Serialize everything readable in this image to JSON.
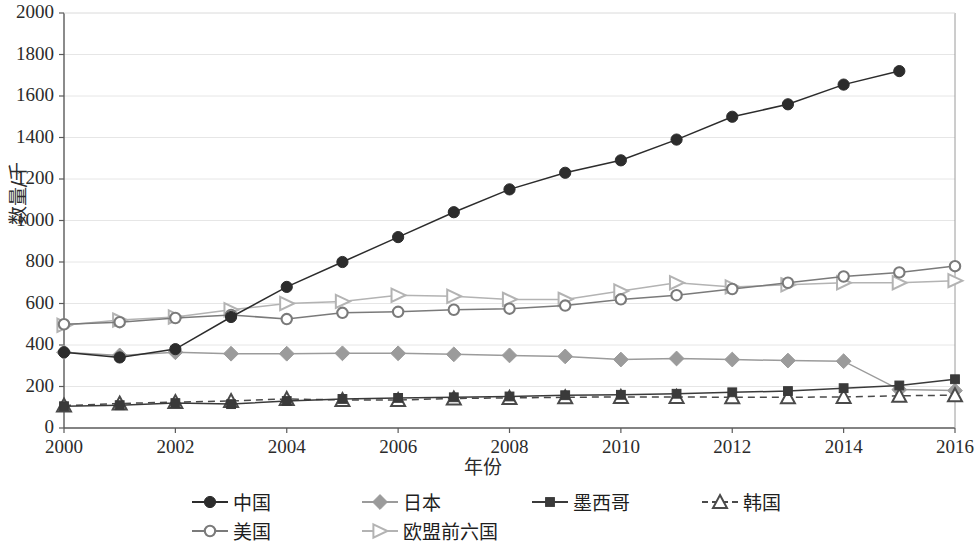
{
  "chart_data": {
    "type": "line",
    "title": "",
    "xlabel": "年份",
    "ylabel": "数量/千",
    "xlim": [
      2000,
      2016
    ],
    "ylim": [
      0,
      2000
    ],
    "grid": true,
    "legend_position": "bottom",
    "x": [
      2000,
      2001,
      2002,
      2003,
      2004,
      2005,
      2006,
      2007,
      2008,
      2009,
      2010,
      2011,
      2012,
      2013,
      2014,
      2015,
      2016
    ],
    "xticks": [
      "2000",
      "2002",
      "2004",
      "2006",
      "2008",
      "2010",
      "2012",
      "2014",
      "2016"
    ],
    "yticks": [
      "0",
      "200",
      "400",
      "600",
      "800",
      "1000",
      "1200",
      "1400",
      "1600",
      "1800",
      "2000"
    ],
    "series": [
      {
        "name": "中国",
        "color": "#2c2c2c",
        "marker": "filled-circle",
        "dash": false,
        "values": [
          365,
          340,
          380,
          535,
          680,
          800,
          920,
          1040,
          1150,
          1230,
          1290,
          1390,
          1500,
          1560,
          1655,
          1720,
          null
        ]
      },
      {
        "name": "美国",
        "color": "#7a7a7a",
        "marker": "open-circle",
        "dash": false,
        "values": [
          500,
          510,
          530,
          545,
          525,
          555,
          560,
          570,
          575,
          590,
          620,
          640,
          670,
          700,
          730,
          750,
          780
        ]
      },
      {
        "name": "日本",
        "color": "#9b9b9b",
        "marker": "filled-diamond",
        "dash": false,
        "values": [
          365,
          350,
          365,
          358,
          358,
          360,
          360,
          355,
          350,
          345,
          330,
          335,
          330,
          325,
          322,
          185,
          180
        ]
      },
      {
        "name": "欧盟前六国",
        "color": "#b3b3b3",
        "marker": "open-right-triangle",
        "dash": false,
        "values": [
          495,
          520,
          535,
          570,
          600,
          610,
          640,
          635,
          620,
          620,
          660,
          700,
          680,
          690,
          700,
          700,
          710
        ]
      },
      {
        "name": "墨西哥",
        "color": "#3a3a3a",
        "marker": "filled-square",
        "dash": false,
        "values": [
          105,
          110,
          120,
          115,
          130,
          140,
          145,
          148,
          152,
          158,
          160,
          165,
          172,
          178,
          192,
          205,
          235
        ]
      },
      {
        "name": "韩国",
        "color": "#4a4a4a",
        "marker": "open-triangle",
        "dash": true,
        "values": [
          108,
          118,
          125,
          130,
          140,
          135,
          135,
          142,
          145,
          148,
          150,
          150,
          148,
          148,
          150,
          155,
          158
        ]
      }
    ]
  },
  "axes": {
    "yticks": [
      "2000",
      "1800",
      "1600",
      "1400",
      "1200",
      "1000",
      "800",
      "600",
      "400",
      "200",
      "0"
    ],
    "xticks": [
      "2000",
      "2002",
      "2004",
      "2006",
      "2008",
      "2010",
      "2012",
      "2014",
      "2016"
    ],
    "xlabel": "年份",
    "ylabel": "数量/千"
  },
  "legend": {
    "items": [
      {
        "label": "中国"
      },
      {
        "label": "日本"
      },
      {
        "label": "墨西哥"
      },
      {
        "label": "韩国"
      },
      {
        "label": "美国"
      },
      {
        "label": "欧盟前六国"
      }
    ]
  }
}
